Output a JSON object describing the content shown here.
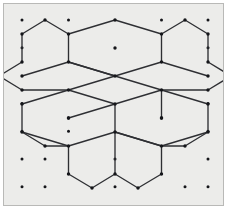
{
  "figure": {
    "canvas": {
      "width": 228,
      "height": 212
    },
    "plot_area": {
      "x": 3,
      "y": 3,
      "width": 221,
      "height": 203
    },
    "colors": {
      "background": "#ececea",
      "border": "#b9b9b7",
      "line": "#2e2f33",
      "dot": "#15161a",
      "page": "#ffffff"
    },
    "style": {
      "line_width": 1.35,
      "lattice_dot_radius": 1.5,
      "vertex_dot_radius": 1.7,
      "center_dot_radius": 1.7
    }
  },
  "chart_data": {
    "type": "scatter",
    "xlabel": "",
    "ylabel": "",
    "xlim": [
      0,
      228
    ],
    "ylim": [
      212,
      0
    ],
    "grid": false,
    "legend": null,
    "annotations": [],
    "lattice": {
      "name": "triangular-dot-lattice",
      "column_spacing": 46.5,
      "row_spacing": 27.8,
      "origin": [
        22,
        20
      ],
      "points": [
        [
          22,
          20
        ],
        [
          68.5,
          20
        ],
        [
          115,
          20
        ],
        [
          161.5,
          20
        ],
        [
          208,
          20
        ],
        [
          22,
          47.8
        ],
        [
          68.5,
          47.8
        ],
        [
          115,
          47.8
        ],
        [
          161.5,
          47.8
        ],
        [
          208,
          47.8
        ],
        [
          22,
          75.6
        ],
        [
          68.5,
          75.6
        ],
        [
          115,
          75.6
        ],
        [
          161.5,
          75.6
        ],
        [
          208,
          75.6
        ],
        [
          22,
          103.4
        ],
        [
          68.5,
          103.4
        ],
        [
          115,
          103.4
        ],
        [
          161.5,
          103.4
        ],
        [
          208,
          103.4
        ],
        [
          22,
          131.2
        ],
        [
          68.5,
          131.2
        ],
        [
          115,
          131.2
        ],
        [
          161.5,
          131.2
        ],
        [
          208,
          131.2
        ],
        [
          22,
          159
        ],
        [
          68.5,
          159
        ],
        [
          115,
          159
        ],
        [
          161.5,
          159
        ],
        [
          208,
          159
        ],
        [
          22,
          186.8
        ],
        [
          68.5,
          186.8
        ],
        [
          115,
          186.8
        ],
        [
          161.5,
          186.8
        ],
        [
          208,
          186.8
        ]
      ],
      "visible_points": [
        [
          22,
          20
        ],
        [
          68.5,
          20
        ],
        [
          161.5,
          20
        ],
        [
          208,
          20
        ],
        [
          22,
          47.8
        ],
        [
          208,
          47.8
        ],
        [
          22,
          103.4
        ],
        [
          208,
          103.4
        ],
        [
          22,
          131.2
        ],
        [
          68.5,
          131.2
        ],
        [
          208,
          131.2
        ],
        [
          22,
          159
        ],
        [
          45,
          159
        ],
        [
          115,
          159
        ],
        [
          208,
          159
        ],
        [
          22,
          186.8
        ],
        [
          45,
          186.8
        ],
        [
          115,
          186.8
        ],
        [
          185,
          186.8
        ],
        [
          208,
          186.8
        ]
      ]
    },
    "hexagons": [
      {
        "name": "top-hexagon",
        "center": [
          115,
          48
        ],
        "center_dot": true,
        "vertices": [
          [
            115,
            20
          ],
          [
            161.5,
            34
          ],
          [
            161.5,
            62
          ],
          [
            115,
            76
          ],
          [
            68.5,
            62
          ],
          [
            68.5,
            34
          ]
        ]
      },
      {
        "name": "lower-left-hexagon",
        "center": [
          68.5,
          118
        ],
        "center_dot": true,
        "vertices": [
          [
            68.5,
            90
          ],
          [
            115,
            104
          ],
          [
            115,
            132
          ],
          [
            68.5,
            146
          ],
          [
            22,
            132
          ],
          [
            22,
            104
          ]
        ]
      },
      {
        "name": "lower-right-hexagon",
        "center": [
          161.5,
          118
        ],
        "center_dot": true,
        "vertices": [
          [
            161.5,
            90
          ],
          [
            208,
            104
          ],
          [
            208,
            132
          ],
          [
            161.5,
            146
          ],
          [
            115,
            132
          ],
          [
            115,
            104
          ]
        ]
      }
    ],
    "star_outline": {
      "name": "outer-star-boundary",
      "closed": true,
      "points": [
        [
          115,
          20
        ],
        [
          161.5,
          34
        ],
        [
          185,
          20
        ],
        [
          208,
          34
        ],
        [
          208,
          62
        ],
        [
          231,
          76
        ],
        [
          208,
          90
        ],
        [
          208,
          104
        ],
        [
          208,
          132
        ],
        [
          185,
          146
        ],
        [
          161.5,
          146
        ],
        [
          161.5,
          174
        ],
        [
          138,
          188
        ],
        [
          115,
          174
        ],
        [
          92,
          188
        ],
        [
          68.5,
          174
        ],
        [
          68.5,
          146
        ],
        [
          45,
          146
        ],
        [
          22,
          132
        ],
        [
          22,
          104
        ],
        [
          22,
          90
        ],
        [
          -1,
          76
        ],
        [
          22,
          62
        ],
        [
          22,
          34
        ],
        [
          45,
          20
        ],
        [
          68.5,
          34
        ]
      ]
    },
    "series": [
      {
        "name": "pattern-edges",
        "type": "segments",
        "values": [
          [
            [
              115,
              20
            ],
            [
              161.5,
              34
            ]
          ],
          [
            [
              115,
              20
            ],
            [
              68.5,
              34
            ]
          ],
          [
            [
              161.5,
              34
            ],
            [
              185,
              20
            ]
          ],
          [
            [
              185,
              20
            ],
            [
              208,
              34
            ]
          ],
          [
            [
              208,
              34
            ],
            [
              208,
              62
            ]
          ],
          [
            [
              208,
              62
            ],
            [
              231,
              76
            ]
          ],
          [
            [
              231,
              76
            ],
            [
              208,
              90
            ]
          ],
          [
            [
              208,
              90
            ],
            [
              161.5,
              90
            ]
          ],
          [
            [
              161.5,
              34
            ],
            [
              161.5,
              62
            ]
          ],
          [
            [
              161.5,
              62
            ],
            [
              115,
              76
            ]
          ],
          [
            [
              115,
              76
            ],
            [
              68.5,
              62
            ]
          ],
          [
            [
              68.5,
              34
            ],
            [
              68.5,
              62
            ]
          ],
          [
            [
              68.5,
              34
            ],
            [
              45,
              20
            ]
          ],
          [
            [
              45,
              20
            ],
            [
              22,
              34
            ]
          ],
          [
            [
              22,
              34
            ],
            [
              22,
              62
            ]
          ],
          [
            [
              22,
              62
            ],
            [
              -1,
              76
            ]
          ],
          [
            [
              -1,
              76
            ],
            [
              22,
              90
            ]
          ],
          [
            [
              22,
              90
            ],
            [
              68.5,
              90
            ]
          ],
          [
            [
              68.5,
              62
            ],
            [
              115,
              76
            ]
          ],
          [
            [
              161.5,
              62
            ],
            [
              208,
              76
            ]
          ],
          [
            [
              68.5,
              62
            ],
            [
              22,
              76
            ]
          ],
          [
            [
              115,
              76
            ],
            [
              161.5,
              90
            ]
          ],
          [
            [
              115,
              76
            ],
            [
              68.5,
              90
            ]
          ],
          [
            [
              68.5,
              90
            ],
            [
              115,
              104
            ]
          ],
          [
            [
              115,
              104
            ],
            [
              161.5,
              90
            ]
          ],
          [
            [
              161.5,
              90
            ],
            [
              208,
              104
            ]
          ],
          [
            [
              68.5,
              90
            ],
            [
              22,
              104
            ]
          ],
          [
            [
              22,
              104
            ],
            [
              22,
              132
            ]
          ],
          [
            [
              22,
              132
            ],
            [
              68.5,
              146
            ]
          ],
          [
            [
              68.5,
              146
            ],
            [
              115,
              132
            ]
          ],
          [
            [
              115,
              132
            ],
            [
              115,
              104
            ]
          ],
          [
            [
              115,
              104
            ],
            [
              68.5,
              118
            ]
          ],
          [
            [
              208,
              104
            ],
            [
              208,
              132
            ]
          ],
          [
            [
              208,
              132
            ],
            [
              161.5,
              146
            ]
          ],
          [
            [
              161.5,
              146
            ],
            [
              115,
              132
            ]
          ],
          [
            [
              115,
              132
            ],
            [
              161.5,
              146
            ]
          ],
          [
            [
              161.5,
              90
            ],
            [
              161.5,
              118
            ]
          ],
          [
            [
              68.5,
              146
            ],
            [
              68.5,
              174
            ]
          ],
          [
            [
              68.5,
              174
            ],
            [
              92,
              188
            ]
          ],
          [
            [
              92,
              188
            ],
            [
              115,
              174
            ]
          ],
          [
            [
              115,
              174
            ],
            [
              138,
              188
            ]
          ],
          [
            [
              138,
              188
            ],
            [
              161.5,
              174
            ]
          ],
          [
            [
              161.5,
              174
            ],
            [
              161.5,
              146
            ]
          ],
          [
            [
              115,
              132
            ],
            [
              115,
              174
            ]
          ],
          [
            [
              22,
              132
            ],
            [
              45,
              146
            ]
          ],
          [
            [
              45,
              146
            ],
            [
              68.5,
              146
            ]
          ],
          [
            [
              208,
              132
            ],
            [
              185,
              146
            ]
          ],
          [
            [
              185,
              146
            ],
            [
              161.5,
              146
            ]
          ]
        ]
      }
    ]
  }
}
